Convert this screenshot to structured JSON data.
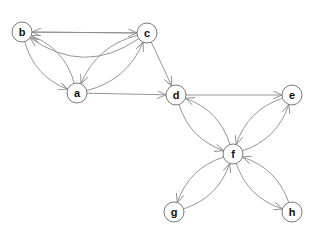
{
  "graph": {
    "type": "directed",
    "nodes": [
      {
        "id": "a",
        "label": "a",
        "x": 77,
        "y": 93
      },
      {
        "id": "b",
        "label": "b",
        "x": 22,
        "y": 32
      },
      {
        "id": "c",
        "label": "c",
        "x": 147,
        "y": 33
      },
      {
        "id": "d",
        "label": "d",
        "x": 176,
        "y": 95
      },
      {
        "id": "e",
        "label": "e",
        "x": 292,
        "y": 95
      },
      {
        "id": "f",
        "label": "f",
        "x": 233,
        "y": 154
      },
      {
        "id": "g",
        "label": "g",
        "x": 174,
        "y": 212
      },
      {
        "id": "h",
        "label": "h",
        "x": 292,
        "y": 212
      }
    ],
    "edges": [
      {
        "from": "c",
        "to": "b",
        "curve": -0.35
      },
      {
        "from": "c",
        "to": "b",
        "curve": 0
      },
      {
        "from": "b",
        "to": "c",
        "curve": 0
      },
      {
        "from": "a",
        "to": "b",
        "curve": 0.25
      },
      {
        "from": "b",
        "to": "a",
        "curve": 0.25
      },
      {
        "from": "a",
        "to": "c",
        "curve": 0.25
      },
      {
        "from": "c",
        "to": "a",
        "curve": 0.25
      },
      {
        "from": "a",
        "to": "d",
        "curve": 0
      },
      {
        "from": "c",
        "to": "d",
        "curve": 0
      },
      {
        "from": "d",
        "to": "e",
        "curve": 0
      },
      {
        "from": "d",
        "to": "f",
        "curve": 0.25
      },
      {
        "from": "f",
        "to": "d",
        "curve": 0.25
      },
      {
        "from": "e",
        "to": "f",
        "curve": 0.25
      },
      {
        "from": "f",
        "to": "e",
        "curve": 0.25
      },
      {
        "from": "f",
        "to": "g",
        "curve": 0.25
      },
      {
        "from": "g",
        "to": "f",
        "curve": 0.25
      },
      {
        "from": "f",
        "to": "h",
        "curve": 0.25
      },
      {
        "from": "h",
        "to": "f",
        "curve": 0.25
      }
    ],
    "node_radius": 10,
    "colors": {
      "edge": "#8a8a8a",
      "node_stroke": "#7a7a7a",
      "node_fill": "#ffffff",
      "label": "#111111"
    }
  }
}
